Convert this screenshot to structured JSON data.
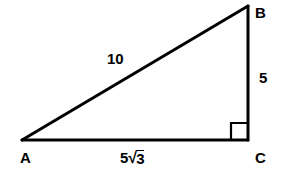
{
  "figure": {
    "type": "geometry-diagram",
    "shape": "right-triangle",
    "background_color": "#ffffff",
    "stroke_color": "#000000",
    "stroke_width": 3
  },
  "vertices": {
    "a": {
      "label": "A",
      "x": 22,
      "y": 140
    },
    "b": {
      "label": "B",
      "x": 248,
      "y": 6
    },
    "c": {
      "label": "C",
      "x": 248,
      "y": 140
    }
  },
  "sides": {
    "hypotenuse": {
      "label": "10",
      "from": "A",
      "to": "B"
    },
    "vertical_leg": {
      "label": "5",
      "from": "B",
      "to": "C"
    },
    "base_leg": {
      "label": "5√3",
      "coefficient": "5",
      "radical_sign": "√",
      "radicand": "3",
      "from": "A",
      "to": "C"
    }
  },
  "markers": {
    "right_angle": {
      "at_vertex": "C",
      "label": "right-angle-marker",
      "size": 16
    }
  }
}
